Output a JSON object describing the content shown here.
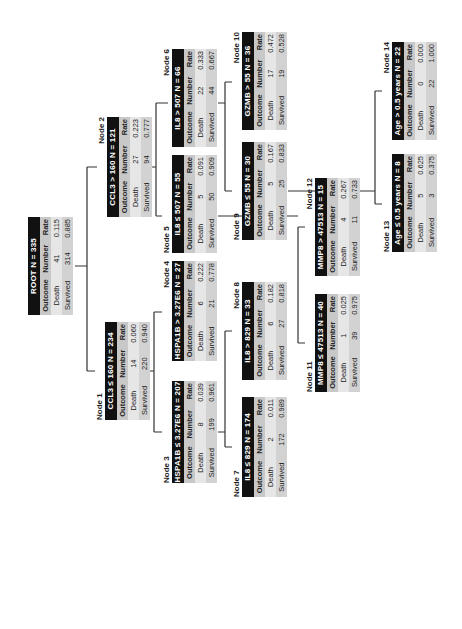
{
  "tree": {
    "columns": [
      "Outcome",
      "Number",
      "Rate"
    ],
    "nodes": [
      {
        "id": "root",
        "label": "",
        "header": "ROOT   N = 335",
        "rows": [
          [
            "Death",
            "41",
            "0.115"
          ],
          [
            "Survived",
            "314",
            "0.885"
          ]
        ]
      },
      {
        "id": "node1",
        "label": "Node 1",
        "header": "CCL3 ≤ 160   N = 234",
        "rows": [
          [
            "Death",
            "14",
            "0.060"
          ],
          [
            "Survived",
            "220",
            "0.940"
          ]
        ]
      },
      {
        "id": "node2",
        "label": "Node 2",
        "header": "CCL3 > 160   N = 121",
        "rows": [
          [
            "Death",
            "27",
            "0.223"
          ],
          [
            "Survived",
            "94",
            "0.777"
          ]
        ]
      },
      {
        "id": "node3",
        "label": "Node 3",
        "header": "HSPA1B ≤ 3.27E6  N = 207",
        "rows": [
          [
            "Death",
            "8",
            "0.039"
          ],
          [
            "Survived",
            "199",
            "0.961"
          ]
        ]
      },
      {
        "id": "node4",
        "label": "Node 4",
        "header": "HSPA1B > 3.27E6   N = 27",
        "rows": [
          [
            "Death",
            "6",
            "0.222"
          ],
          [
            "Survived",
            "21",
            "0.778"
          ]
        ]
      },
      {
        "id": "node5",
        "label": "Node 5",
        "header": "IL8 ≤ 507   N = 55",
        "rows": [
          [
            "Death",
            "5",
            "0.091"
          ],
          [
            "Survived",
            "50",
            "0.909"
          ]
        ]
      },
      {
        "id": "node6",
        "label": "Node 6",
        "header": "IL8 > 507   N = 66",
        "rows": [
          [
            "Death",
            "22",
            "0.333"
          ],
          [
            "Survived",
            "44",
            "0.667"
          ]
        ]
      },
      {
        "id": "node7",
        "label": "Node 7",
        "header": "IL8 ≤ 829   N = 174",
        "rows": [
          [
            "Death",
            "2",
            "0.011"
          ],
          [
            "Survived",
            "172",
            "0.989"
          ]
        ]
      },
      {
        "id": "node8",
        "label": "Node 8",
        "header": "IL8 > 829   N = 33",
        "rows": [
          [
            "Death",
            "6",
            "0.182"
          ],
          [
            "Survived",
            "27",
            "0.818"
          ]
        ]
      },
      {
        "id": "node9",
        "label": "Node 9",
        "header": "GZMB ≤ 55   N = 30",
        "rows": [
          [
            "Death",
            "5",
            "0.167"
          ],
          [
            "Survived",
            "25",
            "0.833"
          ]
        ]
      },
      {
        "id": "node10",
        "label": "Node 10",
        "header": "GZMB > 55   N = 36",
        "rows": [
          [
            "Death",
            "17",
            "0.472"
          ],
          [
            "Survived",
            "19",
            "0.528"
          ]
        ]
      },
      {
        "id": "node11",
        "label": "Node 11",
        "header": "MMP8 ≤ 47513   N = 40",
        "rows": [
          [
            "Death",
            "1",
            "0.025"
          ],
          [
            "Survived",
            "39",
            "0.975"
          ]
        ]
      },
      {
        "id": "node12",
        "label": "Node 12",
        "header": "MMP8 > 47513   N = 15",
        "rows": [
          [
            "Death",
            "4",
            "0.267"
          ],
          [
            "Survived",
            "11",
            "0.733"
          ]
        ]
      },
      {
        "id": "node13",
        "label": "Node 13",
        "header": "Age ≤ 0.5 years   N = 8",
        "rows": [
          [
            "Death",
            "5",
            "0.625"
          ],
          [
            "Survived",
            "3",
            "0.375"
          ]
        ]
      },
      {
        "id": "node14",
        "label": "Node 14",
        "header": "Age > 0.5 years   N = 22",
        "rows": [
          [
            "Death",
            "0",
            "0.000"
          ],
          [
            "Survived",
            "22",
            "1.000"
          ]
        ]
      }
    ]
  }
}
